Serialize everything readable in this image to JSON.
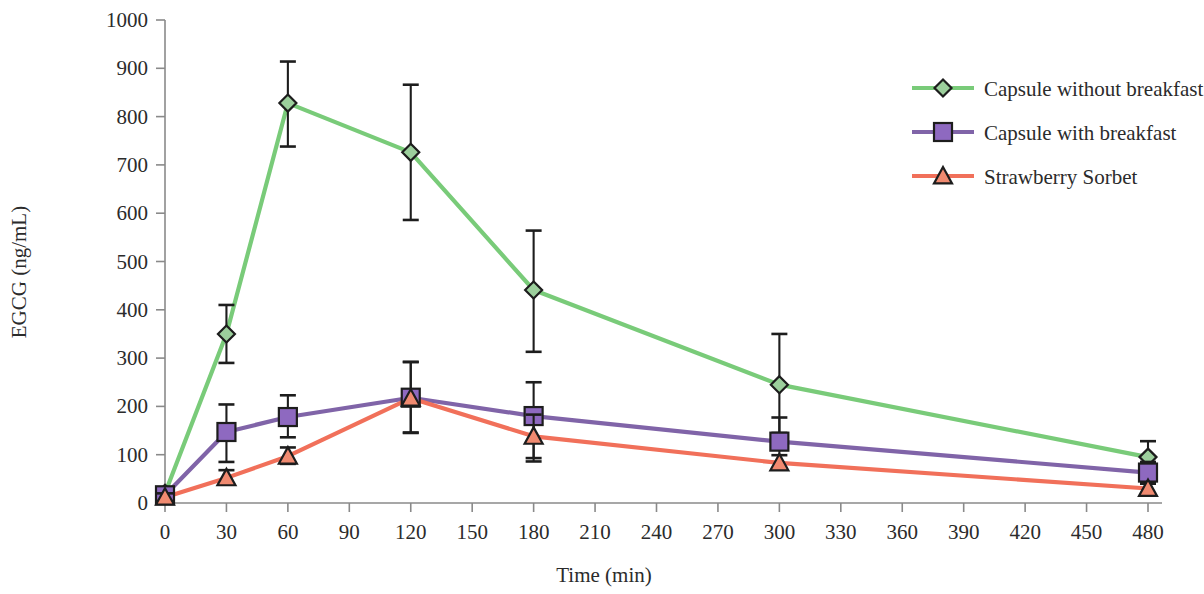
{
  "chart_data": {
    "type": "line",
    "title": "",
    "xlabel": "Time (min)",
    "ylabel": "EGCG (ng/mL)",
    "xlim": [
      0,
      480
    ],
    "ylim": [
      0,
      1000
    ],
    "xticks": [
      0,
      30,
      60,
      90,
      120,
      150,
      180,
      210,
      240,
      270,
      300,
      330,
      360,
      390,
      420,
      450,
      480
    ],
    "yticks": [
      0,
      100,
      200,
      300,
      400,
      500,
      600,
      700,
      800,
      900,
      1000
    ],
    "grid": false,
    "legend_position": "top-right",
    "error_bars": "symmetric-visible",
    "x": [
      0,
      30,
      60,
      120,
      180,
      300,
      480
    ],
    "series": [
      {
        "name": "Capsule without breakfast",
        "color": "#79CB79",
        "marker": "diamond",
        "marker_fill": "#9CCF9C",
        "values": [
          20,
          350,
          828,
          726,
          441,
          245,
          95
        ],
        "err_low": [
          12,
          60,
          90,
          140,
          128,
          100,
          30
        ],
        "err_high": [
          12,
          60,
          86,
          140,
          123,
          105,
          33
        ]
      },
      {
        "name": "Capsule with breakfast",
        "color": "#8064A8",
        "marker": "square",
        "marker_fill": "#8E69C0",
        "values": [
          16,
          147,
          178,
          218,
          180,
          127,
          63
        ],
        "err_low": [
          10,
          62,
          42,
          72,
          94,
          55,
          22
        ],
        "err_high": [
          10,
          57,
          45,
          74,
          70,
          50,
          22
        ]
      },
      {
        "name": "Strawberry Sorbet",
        "color": "#F1705A",
        "marker": "triangle",
        "marker_fill": "#F08A70",
        "values": [
          12,
          52,
          97,
          217,
          138,
          83,
          30
        ],
        "err_low": [
          8,
          14,
          16,
          72,
          45,
          14,
          10
        ],
        "err_high": [
          8,
          16,
          18,
          75,
          45,
          16,
          10
        ]
      }
    ]
  },
  "legend": {
    "items": [
      {
        "label": "Capsule without breakfast"
      },
      {
        "label": "Capsule with breakfast"
      },
      {
        "label": "Strawberry Sorbet"
      }
    ]
  },
  "axes": {
    "y_title": "EGCG (ng/mL)",
    "x_title": "Time (min)",
    "y_tick_labels": [
      "1000",
      "900",
      "800",
      "700",
      "600",
      "500",
      "400",
      "300",
      "200",
      "100",
      "0"
    ],
    "x_tick_labels": [
      "0",
      "30",
      "60",
      "90",
      "120",
      "150",
      "180",
      "210",
      "240",
      "270",
      "300",
      "330",
      "360",
      "390",
      "420",
      "450",
      "480"
    ]
  }
}
